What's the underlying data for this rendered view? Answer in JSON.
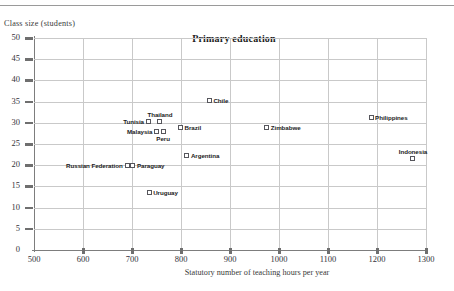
{
  "chart_data": {
    "type": "scatter",
    "title": "Primary education",
    "xlabel": "Statutory number of teaching hours per year",
    "ylabel": "Class size (students)",
    "xlim": [
      500,
      1300
    ],
    "ylim": [
      0,
      50
    ],
    "xticks": [
      500,
      600,
      700,
      800,
      900,
      1000,
      1100,
      1200,
      1300
    ],
    "yticks": [
      0,
      5,
      10,
      15,
      20,
      25,
      30,
      35,
      40,
      45,
      50
    ],
    "grid": true,
    "legend": "none",
    "points": [
      {
        "label": "Russian Federation",
        "x": 690,
        "y": 20.0,
        "label_pos": "left"
      },
      {
        "label": "Paraguay",
        "x": 702,
        "y": 20.0,
        "label_pos": "right"
      },
      {
        "label": "Uruguay",
        "x": 735,
        "y": 13.5,
        "label_pos": "right"
      },
      {
        "label": "Tunisia",
        "x": 733,
        "y": 30.2,
        "label_pos": "left"
      },
      {
        "label": "Thailand",
        "x": 757,
        "y": 30.2,
        "label_pos": "above"
      },
      {
        "label": "Malaysia",
        "x": 749,
        "y": 28.0,
        "label_pos": "left"
      },
      {
        "label": "Peru",
        "x": 764,
        "y": 28.0,
        "label_pos": "below"
      },
      {
        "label": "Brazil",
        "x": 799,
        "y": 29.0,
        "label_pos": "right"
      },
      {
        "label": "Argentina",
        "x": 812,
        "y": 22.3,
        "label_pos": "right"
      },
      {
        "label": "Chile",
        "x": 858,
        "y": 35.3,
        "label_pos": "right"
      },
      {
        "label": "Zimbabwe",
        "x": 975,
        "y": 29.0,
        "label_pos": "right"
      },
      {
        "label": "Philippines",
        "x": 1188,
        "y": 31.2,
        "label_pos": "right"
      },
      {
        "label": "Indonesia",
        "x": 1273,
        "y": 21.5,
        "label_pos": "above"
      }
    ]
  },
  "axes": {
    "y_title": "Class size (students)",
    "x_title": "Statutory number of teaching hours per year"
  },
  "colors": {
    "grid": "#c9c9c9",
    "axis": "#7d7d7d",
    "marker_stroke": "#56565c",
    "text": "#2b2b2b"
  }
}
